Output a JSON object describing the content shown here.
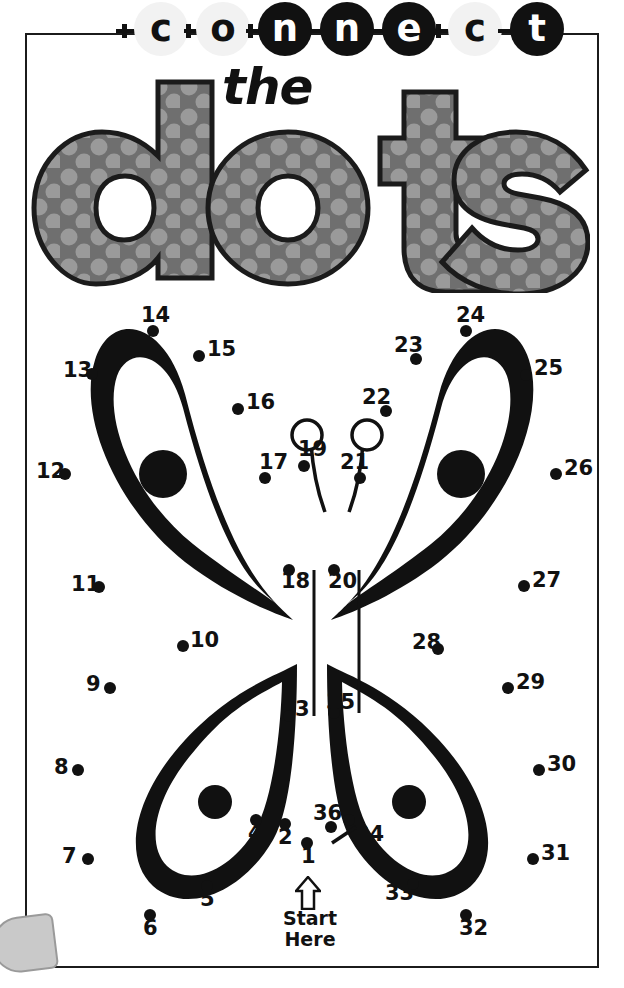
{
  "title": {
    "connect_letters": [
      "c",
      "o",
      "n",
      "n",
      "e",
      "c",
      "t"
    ],
    "connect_styles": [
      "light",
      "light",
      "dark",
      "dark",
      "dark",
      "light",
      "dark"
    ],
    "the_word": "the",
    "dots_word": "dots",
    "dots_letters": [
      "d",
      "o",
      "t",
      "s"
    ]
  },
  "colors": {
    "ink": "#111111",
    "frame": "#1b1b1b",
    "letter_fill": "#6f6f6f",
    "letter_polka": "#9a9a9a",
    "paper": "#ffffff"
  },
  "start": {
    "arrow_icon": "up-arrow-icon",
    "line1": "Start",
    "line2": "Here"
  },
  "puzzle": {
    "type": "connect-the-dots",
    "subject": "butterfly",
    "dot_count": 36,
    "dots": [
      {
        "n": "1",
        "x": 307,
        "y": 843,
        "lx": 301,
        "ly": 855
      },
      {
        "n": "2",
        "x": 285,
        "y": 824,
        "lx": 278,
        "ly": 836
      },
      {
        "n": "3",
        "x": 289,
        "y": 716,
        "lx": 295,
        "ly": 708
      },
      {
        "n": "4",
        "x": 256,
        "y": 820,
        "lx": 248,
        "ly": 832
      },
      {
        "n": "5",
        "x": 207,
        "y": 886,
        "lx": 200,
        "ly": 898
      },
      {
        "n": "6",
        "x": 150,
        "y": 915,
        "lx": 143,
        "ly": 927
      },
      {
        "n": "7",
        "x": 88,
        "y": 859,
        "lx": 62,
        "ly": 855
      },
      {
        "n": "8",
        "x": 78,
        "y": 770,
        "lx": 54,
        "ly": 766
      },
      {
        "n": "9",
        "x": 110,
        "y": 688,
        "lx": 86,
        "ly": 683
      },
      {
        "n": "10",
        "x": 183,
        "y": 646,
        "lx": 190,
        "ly": 639
      },
      {
        "n": "11",
        "x": 99,
        "y": 587,
        "lx": 71,
        "ly": 583
      },
      {
        "n": "12",
        "x": 65,
        "y": 474,
        "lx": 36,
        "ly": 470
      },
      {
        "n": "13",
        "x": 92,
        "y": 374,
        "lx": 63,
        "ly": 369
      },
      {
        "n": "14",
        "x": 153,
        "y": 331,
        "lx": 141,
        "ly": 314
      },
      {
        "n": "15",
        "x": 199,
        "y": 356,
        "lx": 207,
        "ly": 348
      },
      {
        "n": "16",
        "x": 238,
        "y": 409,
        "lx": 246,
        "ly": 401
      },
      {
        "n": "17",
        "x": 265,
        "y": 478,
        "lx": 259,
        "ly": 461
      },
      {
        "n": "18",
        "x": 289,
        "y": 570,
        "lx": 281,
        "ly": 580
      },
      {
        "n": "19",
        "x": 304,
        "y": 466,
        "lx": 298,
        "ly": 448
      },
      {
        "n": "20",
        "x": 334,
        "y": 570,
        "lx": 328,
        "ly": 580
      },
      {
        "n": "21",
        "x": 360,
        "y": 478,
        "lx": 340,
        "ly": 461
      },
      {
        "n": "22",
        "x": 386,
        "y": 411,
        "lx": 362,
        "ly": 396
      },
      {
        "n": "23",
        "x": 416,
        "y": 359,
        "lx": 394,
        "ly": 344
      },
      {
        "n": "24",
        "x": 466,
        "y": 331,
        "lx": 456,
        "ly": 314
      },
      {
        "n": "25",
        "x": 526,
        "y": 375,
        "lx": 534,
        "ly": 367
      },
      {
        "n": "26",
        "x": 556,
        "y": 474,
        "lx": 564,
        "ly": 467
      },
      {
        "n": "27",
        "x": 524,
        "y": 586,
        "lx": 532,
        "ly": 579
      },
      {
        "n": "28",
        "x": 438,
        "y": 649,
        "lx": 412,
        "ly": 641
      },
      {
        "n": "29",
        "x": 508,
        "y": 688,
        "lx": 516,
        "ly": 681
      },
      {
        "n": "30",
        "x": 539,
        "y": 770,
        "lx": 547,
        "ly": 763
      },
      {
        "n": "31",
        "x": 533,
        "y": 859,
        "lx": 541,
        "ly": 852
      },
      {
        "n": "32",
        "x": 466,
        "y": 915,
        "lx": 459,
        "ly": 927
      },
      {
        "n": "33",
        "x": 413,
        "y": 884,
        "lx": 385,
        "ly": 892
      },
      {
        "n": "34",
        "x": 349,
        "y": 820,
        "lx": 355,
        "ly": 833
      },
      {
        "n": "35",
        "x": 334,
        "y": 713,
        "lx": 326,
        "ly": 701
      },
      {
        "n": "36",
        "x": 331,
        "y": 827,
        "lx": 313,
        "ly": 812
      }
    ],
    "prefilled_segments": [
      {
        "from": "18",
        "to": "3"
      },
      {
        "from": "20",
        "to": "35"
      },
      {
        "from": "1",
        "to": "36"
      }
    ]
  }
}
